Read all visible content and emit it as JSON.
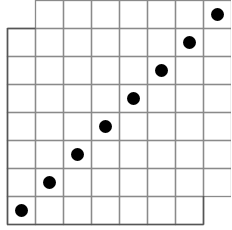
{
  "diagram": {
    "type": "grid-with-dots",
    "rows": 8,
    "cols": 8,
    "cell_size": 28,
    "origin": {
      "x": 7,
      "y": 0
    },
    "line_color": "#8a8a8a",
    "outer_line_color": "#555555",
    "dot_color": "#000000",
    "missing_cells": [
      {
        "row": 0,
        "col": 0
      },
      {
        "row": 7,
        "col": 7
      }
    ],
    "dots": [
      {
        "row": 7,
        "col": 0
      },
      {
        "row": 6,
        "col": 1
      },
      {
        "row": 5,
        "col": 2
      },
      {
        "row": 4,
        "col": 3
      },
      {
        "row": 3,
        "col": 4
      },
      {
        "row": 2,
        "col": 5
      },
      {
        "row": 1,
        "col": 6
      },
      {
        "row": 0,
        "col": 7
      }
    ]
  }
}
